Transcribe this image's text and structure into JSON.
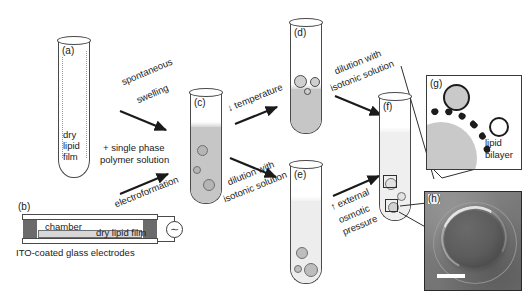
{
  "figure": {
    "caption_less": true,
    "panels": {
      "a": "(a)",
      "b": "(b)",
      "c": "(c)",
      "d": "(d)",
      "e": "(e)",
      "f": "(f)",
      "g": "(g)",
      "h": "(h)"
    }
  },
  "labels": {
    "dry_lipid_film_tube": "dry\nlipid\nfilm",
    "dry_lipid_film_line1": "dry",
    "dry_lipid_film_line2": "lipid",
    "dry_lipid_film_line3": "film",
    "spontaneous_swelling_line1": "spontaneous",
    "spontaneous_swelling_line2": "swelling",
    "single_phase_line1": "+ single phase",
    "single_phase_line2": "polymer solution",
    "electroformation": "electroformation",
    "temperature": "↓ temperature",
    "dilution_line1": "dilution with",
    "dilution_line2": "isotonic solution",
    "dilution2_line1": "dilution with",
    "dilution2_line2": "isotonic solution",
    "osmotic_line1": "↑ external",
    "osmotic_line2": "osmotic",
    "osmotic_line3": "pressure",
    "lipid_bilayer_line1": "lipid",
    "lipid_bilayer_line2": "bilayer",
    "chamber": "chamber",
    "dry_lipid_film_chamber": "dry lipid film",
    "ito_electrodes": "ITO-coated glass electrodes",
    "ac_source_symbol": "∼"
  },
  "colors": {
    "outline": "#4a4a4a",
    "polymer_fill": "#c6c6c6",
    "light_fill": "#ebebeb",
    "vesicle_fill": "#c2c2c2",
    "bilayer": "#1c1c1c",
    "electrode_block": "#6b6b6b",
    "micrograph_bg": "#7d7d7d",
    "scalebar": "#ffffff",
    "text": "#1a1a1a"
  },
  "diagram": {
    "type": "process-flow",
    "steps": [
      {
        "from": "a",
        "to": "c",
        "label": "spontaneous swelling"
      },
      {
        "from": "b",
        "to": "c",
        "label": "electroformation"
      },
      {
        "from": "c",
        "to": "d",
        "label": "↓ temperature"
      },
      {
        "from": "c",
        "to": "e",
        "label": "dilution with isotonic solution"
      },
      {
        "from": "d",
        "to": "f",
        "label": "dilution with isotonic solution"
      },
      {
        "from": "e",
        "to": "f",
        "label": "↑ external osmotic pressure"
      },
      {
        "from": "f",
        "to": "g",
        "label": "zoom: lipid bilayer"
      },
      {
        "from": "f",
        "to": "h",
        "label": "zoom: micrograph"
      }
    ]
  }
}
